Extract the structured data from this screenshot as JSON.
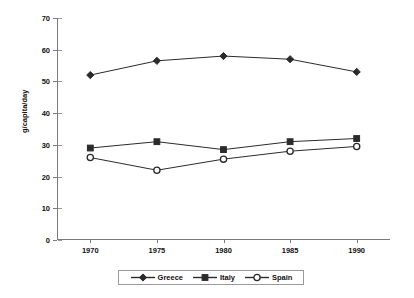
{
  "chart_data": {
    "type": "line",
    "title": "",
    "xlabel": "",
    "ylabel": "g/capita/day",
    "categories": [
      "1970",
      "1975",
      "1980",
      "1985",
      "1990"
    ],
    "x": [
      1970,
      1975,
      1980,
      1985,
      1990
    ],
    "ylim": [
      0,
      70
    ],
    "yticks": [
      0,
      10,
      20,
      30,
      40,
      50,
      60,
      70
    ],
    "ytick_labels": [
      "0",
      "10",
      "20",
      "30",
      "40",
      "50",
      "60",
      "70"
    ],
    "grid": false,
    "legend_position": "bottom",
    "series": [
      {
        "name": "Greece",
        "marker": "filled-diamond",
        "color": "#2b2b2b",
        "values": [
          52,
          56.5,
          58,
          57,
          53
        ]
      },
      {
        "name": "Italy",
        "marker": "filled-square",
        "color": "#2b2b2b",
        "values": [
          29,
          31,
          28.5,
          31,
          32
        ]
      },
      {
        "name": "Spain",
        "marker": "open-circle",
        "color": "#2b2b2b",
        "values": [
          26,
          22,
          25.5,
          28,
          29.5
        ]
      }
    ]
  },
  "legend": {
    "items": [
      {
        "label": "Greece"
      },
      {
        "label": "Italy"
      },
      {
        "label": "Spain"
      }
    ]
  },
  "axes": {
    "y_title": "g/capita/day"
  }
}
